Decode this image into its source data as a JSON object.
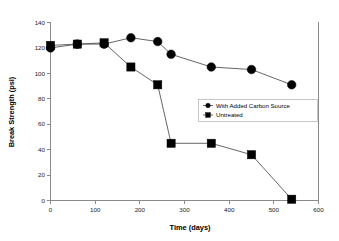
{
  "chart_data": {
    "type": "line",
    "title": "",
    "xlabel": "Time (days)",
    "ylabel": "Break Strength (psi)",
    "xlim": [
      0,
      600
    ],
    "ylim": [
      0,
      140
    ],
    "xticks": [
      0,
      100,
      200,
      300,
      400,
      500,
      600
    ],
    "yticks": [
      0,
      20,
      40,
      60,
      80,
      100,
      120,
      140
    ],
    "grid": false,
    "legend_position": "center-right",
    "series": [
      {
        "name": "With Added Carbon Source",
        "marker": "circle",
        "color": "#000000",
        "x": [
          0,
          60,
          120,
          180,
          240,
          270,
          360,
          450,
          540
        ],
        "values": [
          120,
          123,
          123,
          128,
          125,
          115,
          105,
          103,
          91
        ]
      },
      {
        "name": "Untreated",
        "marker": "square",
        "color": "#000000",
        "x": [
          0,
          60,
          120,
          180,
          240,
          270,
          360,
          450,
          540
        ],
        "values": [
          122,
          123,
          124,
          105,
          91,
          45,
          45,
          36,
          1
        ]
      }
    ]
  },
  "axes": {
    "x_title": "Time (days)",
    "y_title": "Break Strength (psi)",
    "x_tick_labels": [
      "0",
      "100",
      "200",
      "300",
      "400",
      "500",
      "600"
    ],
    "y_tick_labels": [
      "0",
      "20",
      "40",
      "60",
      "80",
      "100",
      "120",
      "140"
    ]
  },
  "legend": {
    "entries": [
      {
        "label": "With Added Carbon Source",
        "marker": "circle"
      },
      {
        "label": "Untreated",
        "marker": "square"
      }
    ]
  },
  "colors": {
    "marker": "#000000",
    "line": "#555555",
    "axis": "#8a8a8a",
    "legend_border": "#b8b8b8",
    "background": "#ffffff"
  }
}
